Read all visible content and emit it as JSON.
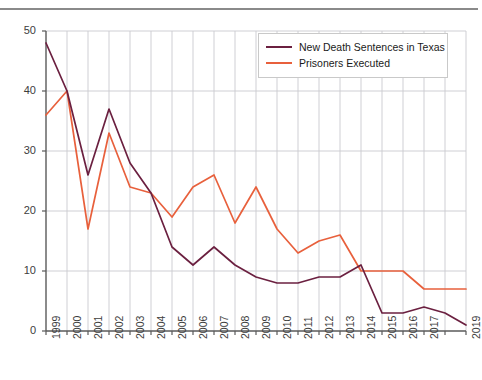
{
  "chart_data": {
    "type": "line",
    "title": "",
    "subtitle": "",
    "xlabel": "",
    "ylabel": "",
    "grid": true,
    "legend_position": "top-right",
    "ylim": [
      0,
      50
    ],
    "yticks": [
      0,
      10,
      20,
      30,
      40,
      50
    ],
    "categories": [
      "1999",
      "2000",
      "2001",
      "2002",
      "2003",
      "2004",
      "2005",
      "2006",
      "2007",
      "2008",
      "2009",
      "2010",
      "2011",
      "2012",
      "2013",
      "2014",
      "2015",
      "2016",
      "2017",
      "2018",
      "2019"
    ],
    "xtick_labels": [
      "1999",
      "2000",
      "2001",
      "2002",
      "2003",
      "2004",
      "2005",
      "2006",
      "2007",
      "2008",
      "2009",
      "2010",
      "2011",
      "2012",
      "2013",
      "2014",
      "2015",
      "2016",
      "2017",
      "",
      "2019"
    ],
    "series": [
      {
        "name": "New Death Sentences in Texas",
        "color": "#6b2040",
        "values": [
          48,
          40,
          26,
          37,
          28,
          23,
          14,
          11,
          14,
          11,
          9,
          8,
          8,
          9,
          9,
          11,
          3,
          3,
          4,
          3,
          1
        ]
      },
      {
        "name": "Prisoners Executed",
        "color": "#e8603c",
        "values": [
          36,
          40,
          17,
          33,
          24,
          23,
          19,
          24,
          26,
          18,
          24,
          17,
          13,
          15,
          16,
          10,
          10,
          10,
          7,
          7,
          7
        ]
      }
    ]
  },
  "legend": {
    "entries": [
      {
        "label": "New Death Sentences in Texas",
        "color": "#6b2040"
      },
      {
        "label": "Prisoners Executed",
        "color": "#e8603c"
      }
    ]
  },
  "colors": {
    "death_sentences": "#6b2040",
    "executions": "#e8603c",
    "grid": "#c9c9cf",
    "axis": "#5a5a5a",
    "rule": "#8a8a8a"
  }
}
